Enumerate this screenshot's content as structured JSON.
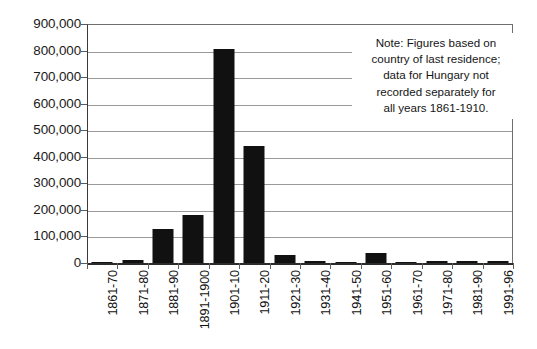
{
  "chart_data": {
    "type": "bar",
    "title": "",
    "subtitle": "",
    "xlabel": "",
    "ylabel": "",
    "ylim": [
      0,
      900000
    ],
    "ytick_labels": [
      "900,000",
      "800,000",
      "700,000",
      "600,000",
      "500,000",
      "400,000",
      "300,000",
      "200,000",
      "100,000",
      "0"
    ],
    "ytick_values": [
      900000,
      800000,
      700000,
      600000,
      500000,
      400000,
      300000,
      200000,
      100000,
      0
    ],
    "grid": true,
    "legend": null,
    "legend_position": "none",
    "bar_color": "#111111",
    "categories": [
      "1861-70",
      "1871-80",
      "1881-90",
      "1891-1900",
      "1901-10",
      "1911-20",
      "1921-30",
      "1931-40",
      "1941-50",
      "1951-60",
      "1961-70",
      "1971-80",
      "1981-90",
      "1991-96"
    ],
    "values": [
      2000,
      11000,
      127000,
      180000,
      806000,
      441000,
      32000,
      8000,
      4000,
      38000,
      5000,
      7000,
      7000,
      6000
    ],
    "annotations": [
      {
        "name": "note",
        "lines": [
          "Note: Figures based on",
          "country of last residence;",
          "data for Hungary not",
          "recorded separately for",
          "all years 1861-1910."
        ]
      }
    ]
  }
}
